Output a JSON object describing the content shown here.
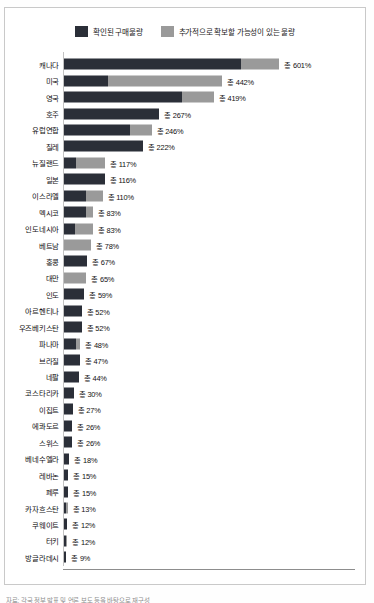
{
  "legend": {
    "items": [
      {
        "label": "확인된 구매물량",
        "color": "#2b2f38",
        "key": "confirmed"
      },
      {
        "label": "추가적으로 확보할 가능성이 있는 물량",
        "color": "#9a9a9a",
        "key": "potential"
      }
    ]
  },
  "axis": {
    "ticks": [
      "0%",
      "200%",
      "400%",
      "600%",
      "800%"
    ],
    "tick_values": [
      0,
      200,
      400,
      600,
      800
    ]
  },
  "footer": {
    "source": "자료: 각국 정부 발표 및 언론 보도 등을 바탕으로 재구성"
  },
  "chart_data": {
    "type": "bar",
    "orientation": "horizontal",
    "stacked": true,
    "title": "",
    "xlabel": "",
    "ylabel": "",
    "xlim": [
      0,
      800
    ],
    "grid": false,
    "legend_position": "top-center",
    "categories": [
      "캐나다",
      "미국",
      "영국",
      "호주",
      "유럽연합",
      "칠레",
      "뉴질랜드",
      "일본",
      "이스라엘",
      "멕시코",
      "인도네시아",
      "베트남",
      "홍콩",
      "대만",
      "인도",
      "아르헨티나",
      "우즈베키스탄",
      "파나마",
      "브라질",
      "네팔",
      "코스타리카",
      "이집트",
      "에콰도르",
      "스위스",
      "베네수엘라",
      "레바논",
      "페루",
      "카자흐스탄",
      "쿠웨이트",
      "터키",
      "방글라데시"
    ],
    "series": [
      {
        "name": "확인된 구매물량",
        "color": "#2b2f38",
        "values": [
          494,
          124,
          330,
          267,
          185,
          222,
          36,
          116,
          64,
          63,
          33,
          0,
          67,
          0,
          59,
          52,
          52,
          36,
          47,
          44,
          30,
          27,
          26,
          26,
          18,
          15,
          15,
          9,
          12,
          7,
          9
        ]
      },
      {
        "name": "추가적으로 확보할 가능성이 있는 물량",
        "color": "#9a9a9a",
        "values": [
          107,
          318,
          89,
          0,
          61,
          0,
          81,
          0,
          46,
          20,
          50,
          78,
          0,
          65,
          0,
          0,
          0,
          12,
          0,
          0,
          0,
          0,
          0,
          0,
          0,
          0,
          0,
          4,
          0,
          5,
          0
        ]
      }
    ],
    "totals": [
      601,
      442,
      419,
      267,
      246,
      222,
      117,
      116,
      110,
      83,
      83,
      78,
      67,
      65,
      59,
      52,
      52,
      48,
      47,
      44,
      30,
      27,
      26,
      26,
      18,
      15,
      15,
      13,
      12,
      12,
      9
    ],
    "total_labels": [
      "총 601%",
      "총 442%",
      "총 419%",
      "총 267%",
      "총 246%",
      "총 222%",
      "총 117%",
      "총 116%",
      "총 110%",
      "총 83%",
      "총 83%",
      "총 78%",
      "총 67%",
      "총 65%",
      "총 59%",
      "총 52%",
      "총 52%",
      "총 48%",
      "총 47%",
      "총 44%",
      "총 30%",
      "총 27%",
      "총 26%",
      "총 26%",
      "총 18%",
      "총 15%",
      "총 15%",
      "총 13%",
      "총 12%",
      "총 12%",
      "총 9%"
    ]
  }
}
